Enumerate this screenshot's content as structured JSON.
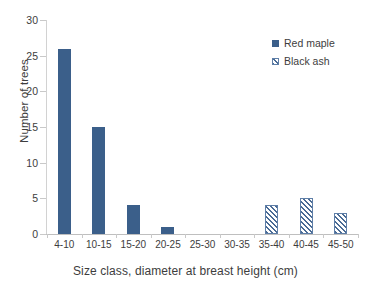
{
  "chart_data": {
    "type": "bar",
    "title": "",
    "subtitle": "",
    "xlabel": "Size class, diameter at breast height (cm)",
    "ylabel": "Number of trees",
    "categories": [
      "4-10",
      "10-15",
      "15-20",
      "20-25",
      "25-30",
      "30-35",
      "35-40",
      "40-45",
      "45-50"
    ],
    "series": [
      {
        "name": "Red maple",
        "style": "solid",
        "color": "#3b5f8a",
        "values": [
          26,
          15,
          4,
          1,
          0,
          0,
          0,
          0,
          0
        ]
      },
      {
        "name": "Black ash",
        "style": "diagonal-hatch",
        "color": "#4a6b95",
        "values": [
          0,
          0,
          0,
          0,
          0,
          0,
          4,
          5,
          3
        ]
      }
    ],
    "ylim": [
      0,
      30
    ],
    "ytick_values": [
      0,
      5,
      10,
      15,
      20,
      25,
      30
    ],
    "ytick_labels": [
      "0",
      "5",
      "10",
      "15",
      "20",
      "25",
      "30"
    ],
    "grid": false,
    "legend_position": "top-right"
  },
  "legend": {
    "entries": [
      {
        "label": "Red maple"
      },
      {
        "label": "Black ash"
      }
    ]
  },
  "colors": {
    "bar_solid": "#3b5f8a",
    "bar_hatch": "#4a6b95",
    "axis_line": "#c9c9c9",
    "text": "#3d3d3d",
    "background": "#ffffff"
  }
}
